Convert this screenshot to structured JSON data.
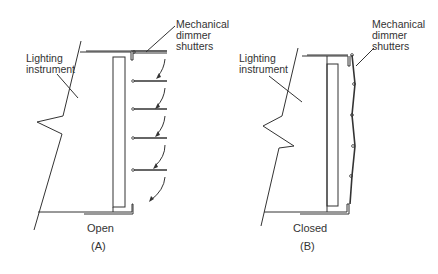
{
  "panels": [
    {
      "id": "A",
      "instrument_label": "Lighting\ninstrument",
      "shutter_label": "Mechanical\ndimmer\nshutters",
      "state": "Open",
      "caption": "(A)"
    },
    {
      "id": "B",
      "instrument_label": "Lighting\ninstrument",
      "shutter_label": "Mechanical\ndimmer\nshutters",
      "state": "Closed",
      "caption": "(B)"
    }
  ],
  "colors": {
    "line": "#333333",
    "background": "#ffffff"
  }
}
